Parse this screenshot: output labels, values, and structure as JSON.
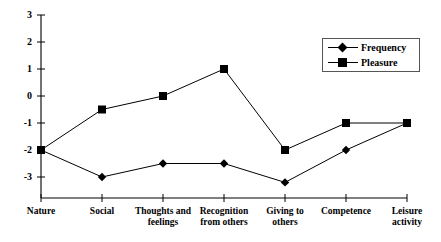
{
  "chart_data": {
    "type": "line",
    "title": "",
    "xlabel": "",
    "ylabel": "",
    "categories": [
      "Nature",
      "Social",
      "Thoughts and\nfeelings",
      "Recognition\nfrom others",
      "Giving to\nothers",
      "Competence",
      "Leisure\nactivity"
    ],
    "series": [
      {
        "name": "Frequency",
        "marker": "diamond",
        "color": "#000000",
        "values": [
          -2,
          -3,
          -2.5,
          -2.5,
          -3.2,
          -2,
          -1
        ]
      },
      {
        "name": "Pleasure",
        "marker": "square",
        "color": "#000000",
        "values": [
          -2,
          -0.5,
          0,
          1,
          -2,
          -1,
          -1
        ]
      }
    ],
    "ylim": [
      -3,
      3
    ],
    "yticks": [
      3,
      2,
      1,
      0,
      -1,
      -2,
      -3
    ],
    "ytick_labels": [
      "3",
      "2",
      "1",
      "0",
      "-1",
      "-2",
      "-3"
    ],
    "grid": false,
    "legend_position": "top-right"
  },
  "legend": {
    "entries": [
      {
        "label": "Frequency",
        "marker": "diamond-marker-icon"
      },
      {
        "label": "Pleasure",
        "marker": "square-marker-icon"
      }
    ]
  }
}
